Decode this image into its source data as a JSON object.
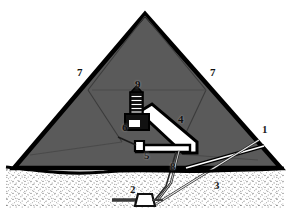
{
  "figure": {
    "type": "cutaway-section-diagram",
    "view": "vertical section through pyramid, ground level shown as stippled sand",
    "colors": {
      "masonry_fill": "#5a5a5a",
      "masonry_outline": "#000000",
      "passage_fill": "#ffffff",
      "passage_outline": "#000000",
      "ground_line": "#000000",
      "sand_stipple": "#6e6e6e",
      "background": "#ffffff",
      "label_text": "#111111"
    }
  },
  "callouts": [
    {
      "id": "callout-1",
      "text": "1",
      "x": 262,
      "y": 130,
      "tone": "on-light",
      "refers_to": "entrance-passage-right"
    },
    {
      "id": "callout-2",
      "text": "2",
      "x": 132,
      "y": 190,
      "tone": "on-light",
      "refers_to": "subterranean-entrance-structure"
    },
    {
      "id": "callout-3",
      "text": "3",
      "x": 216,
      "y": 186,
      "tone": "on-light",
      "refers_to": "descending-passage"
    },
    {
      "id": "callout-4",
      "text": "4",
      "x": 180,
      "y": 120,
      "tone": "on-dark",
      "refers_to": "ascending-passage-zone"
    },
    {
      "id": "callout-5",
      "text": "5",
      "x": 146,
      "y": 155,
      "tone": "on-light",
      "refers_to": "lower-chamber-junction"
    },
    {
      "id": "callout-6",
      "text": "6",
      "x": 125,
      "y": 128,
      "tone": "on-dark",
      "refers_to": "kings-chamber-block"
    },
    {
      "id": "callout-7",
      "text": "7",
      "x": 79,
      "y": 73,
      "tone": "on-dark",
      "refers_to": "pyramid-core-masonry-left"
    },
    {
      "id": "callout-7b",
      "text": "7",
      "x": 212,
      "y": 73,
      "tone": "on-dark",
      "refers_to": "pyramid-core-masonry-right"
    },
    {
      "id": "callout-8",
      "text": "8",
      "x": 172,
      "y": 167,
      "tone": "on-light",
      "refers_to": "shaft-vertical"
    },
    {
      "id": "callout-9",
      "text": "9",
      "x": 137,
      "y": 85,
      "tone": "on-dark",
      "refers_to": "relieving-chambers-stack"
    }
  ],
  "geometry": {
    "pyramid_outline": "M145,14 L281,168 L14,168 Z",
    "ground_line": "M6,168 L284,168",
    "sand_band": {
      "top": 168,
      "bottom": 206
    },
    "internal_seams": [
      "M145,14 L90,88",
      "M145,14 L205,88",
      "M90,88 L124,140",
      "M205,88 L178,152",
      "M96,150 L205,88"
    ],
    "passages": [
      {
        "name": "descending-passage",
        "path": "M258,143 L158,205"
      },
      {
        "name": "entrance-passage",
        "path": "M262,150 L186,170"
      },
      {
        "name": "ascending-passage",
        "path": "M138,118 L192,150"
      },
      {
        "name": "horizontal-passage",
        "path": "M142,148 L190,148"
      },
      {
        "name": "vertical-shaft",
        "path": "M176,150 L168,196"
      }
    ]
  }
}
